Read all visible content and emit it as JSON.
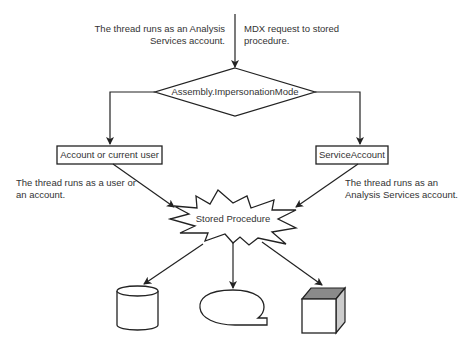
{
  "diagram": {
    "annotations": {
      "top_left": [
        "The thread runs as an Analysis",
        "Services account."
      ],
      "top_right": [
        "MDX request to stored",
        "procedure."
      ],
      "mid_left": [
        "The thread runs as a user or",
        "an account."
      ],
      "mid_right": [
        "The thread runs as an",
        "Analysis Services account."
      ]
    },
    "nodes": {
      "decision": "Assembly.ImpersonationMode",
      "left_box": "Account or current user",
      "right_box": "ServiceAccount",
      "starburst": "Stored Procedure"
    },
    "resources": [
      {
        "shape": "cylinder",
        "icon": "database-icon"
      },
      {
        "shape": "speech-bubble",
        "icon": "callout-icon"
      },
      {
        "shape": "cube",
        "icon": "cube-icon"
      }
    ],
    "colors": {
      "line": "#222222",
      "cube_top": "#8a8a8a",
      "cube_side": "#cccccc",
      "background": "#ffffff"
    }
  }
}
